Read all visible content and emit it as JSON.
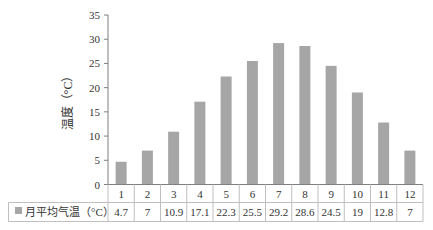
{
  "chart_data": {
    "type": "bar",
    "title": "",
    "xlabel": "",
    "ylabel": "温度（°C）",
    "ylim": [
      0,
      35
    ],
    "yticks": [
      0,
      5,
      10,
      15,
      20,
      25,
      30,
      35
    ],
    "grid": false,
    "legend_position": "data-table",
    "categories": [
      "1",
      "2",
      "3",
      "4",
      "5",
      "6",
      "7",
      "8",
      "9",
      "10",
      "11",
      "12"
    ],
    "series": [
      {
        "name": "月平均气温（°C）",
        "color": "#a6a6a6",
        "values": [
          4.7,
          7,
          10.9,
          17.1,
          22.3,
          25.5,
          29.2,
          28.6,
          24.5,
          19,
          12.8,
          7
        ],
        "value_labels": [
          "4.7",
          "7",
          "10.9",
          "17.1",
          "22.3",
          "25.5",
          "29.2",
          "28.6",
          "24.5",
          "19",
          "12.8",
          "7"
        ]
      }
    ]
  },
  "colors": {
    "bar": "#a6a6a6",
    "axis": "#7f7f7f",
    "table_border": "#bfbfbf",
    "text": "#333333"
  }
}
